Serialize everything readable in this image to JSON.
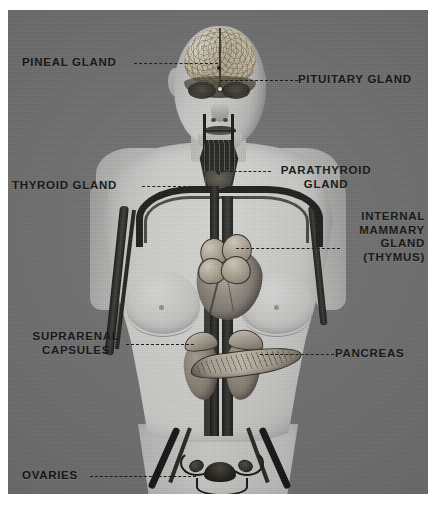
{
  "plate": {
    "title": "Endocrine Glands of the Human Body",
    "background_color": "#6f6f6f",
    "body_color": "#c9c9c7",
    "label_color": "#0d0d0c",
    "leader_style": "dashed"
  },
  "labels": {
    "pineal": "PINEAL GLAND",
    "pituitary": "PITUITARY GLAND",
    "thyroid": "THYROID GLAND",
    "parathyroid": "PARATHYROID\nGLAND",
    "thymus": "INTERNAL\nMAMMARY\nGLAND\n(THYMUS)",
    "suprarenal": "SUPRARENAL\nCAPSULES",
    "pancreas": "PANCREAS",
    "ovaries": "OVARIES"
  },
  "anatomy": {
    "head": "head-cutaway",
    "brain": "brain",
    "heart": "heart",
    "thymus_lobes": "thymus-lobes",
    "thyroid_gland": "thyroid-gland",
    "kidney_left": "left-kidney",
    "kidney_right": "right-kidney",
    "adrenal_left": "left-adrenal-gland",
    "adrenal_right": "right-adrenal-gland",
    "pancreas_organ": "pancreas",
    "uterus": "uterus",
    "ovary_left": "left-ovary",
    "ovary_right": "right-ovary",
    "aorta": "aorta",
    "vena_cava": "vena-cava",
    "aortic_arch": "aortic-arch",
    "iliac_vessels": "iliac-vessels"
  }
}
